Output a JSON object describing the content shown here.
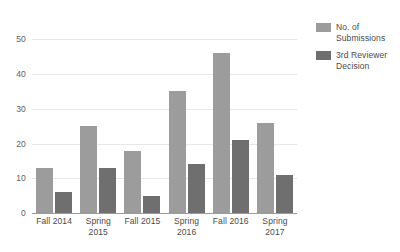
{
  "chart_data": {
    "type": "bar",
    "title": "",
    "xlabel": "",
    "ylabel": "",
    "categories": [
      "Fall 2014",
      "Spring\n2015",
      "Fall 2015",
      "Spring\n2016",
      "Fall 2016",
      "Spring\n2017"
    ],
    "series": [
      {
        "name": "No. of\nSubmissions",
        "color": "#9c9c9c",
        "values": [
          13,
          25,
          18,
          35,
          46,
          26
        ]
      },
      {
        "name": "3rd Reviewer\nDecision",
        "color": "#6f6f6f",
        "values": [
          6,
          13,
          5,
          14,
          21,
          11
        ]
      }
    ],
    "ylim": [
      0,
      55
    ],
    "yticks": [
      0,
      10,
      20,
      30,
      40,
      50
    ],
    "ytick_labels": [
      "0",
      "10",
      "20",
      "30",
      "40",
      "50"
    ],
    "grid": true,
    "legend_position": "right"
  }
}
